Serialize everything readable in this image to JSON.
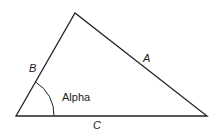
{
  "diagram": {
    "type": "triangle",
    "sides": {
      "a": "A",
      "b": "B",
      "c": "C"
    },
    "angle_label": "Alpha",
    "colors": {
      "stroke": "#222222",
      "background": "#ffffff"
    }
  }
}
